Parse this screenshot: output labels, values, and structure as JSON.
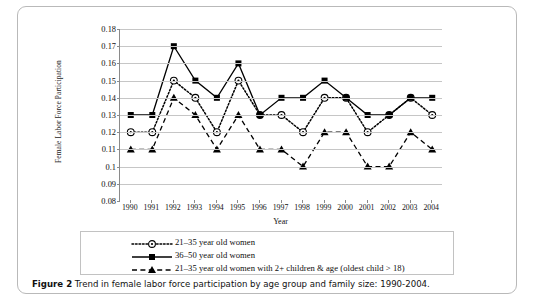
{
  "figure": {
    "caption_bold": "Figure 2",
    "caption_text": " Trend in female labor force participation by age group and family size: 1990-2004."
  },
  "chart_data": {
    "type": "line",
    "title": "",
    "xlabel": "Year",
    "ylabel": "Female Labor Force Participation",
    "categories": [
      "1990",
      "1991",
      "1992",
      "1993",
      "1994",
      "1995",
      "1996",
      "1997",
      "1998",
      "1999",
      "2000",
      "2001",
      "2002",
      "2003",
      "2004"
    ],
    "x": [
      1990,
      1991,
      1992,
      1993,
      1994,
      1995,
      1996,
      1997,
      1998,
      1999,
      2000,
      2001,
      2002,
      2003,
      2004
    ],
    "ylim": [
      0.08,
      0.18
    ],
    "yticks": [
      "0.18",
      "0.17",
      "0.16",
      "0.15",
      "0.14",
      "0.13",
      "0.12",
      "0.11",
      "0.1",
      "0.09",
      "0.08"
    ],
    "ytick_values": [
      0.18,
      0.17,
      0.16,
      0.15,
      0.14,
      0.13,
      0.12,
      0.11,
      0.1,
      0.09,
      0.08
    ],
    "grid": true,
    "legend_position": "bottom",
    "series": [
      {
        "name": "21–35 year old women",
        "marker": "circle-dot",
        "dash": "dotted",
        "color": "#000000",
        "values": [
          0.12,
          0.12,
          0.15,
          0.14,
          0.12,
          0.15,
          0.13,
          0.13,
          0.12,
          0.14,
          0.14,
          0.12,
          0.13,
          0.14,
          0.13
        ]
      },
      {
        "name": "36–50 year old women",
        "marker": "square",
        "dash": "solid",
        "color": "#000000",
        "values": [
          0.13,
          0.13,
          0.17,
          0.15,
          0.14,
          0.16,
          0.13,
          0.14,
          0.14,
          0.15,
          0.14,
          0.13,
          0.13,
          0.14,
          0.14
        ]
      },
      {
        "name": "21–35 year old women with 2+ children & age (oldest child > 18)",
        "marker": "triangle",
        "dash": "dashed",
        "color": "#000000",
        "values": [
          0.11,
          0.11,
          0.14,
          0.13,
          0.11,
          0.13,
          0.11,
          0.11,
          0.1,
          0.12,
          0.12,
          0.1,
          0.1,
          0.12,
          0.11
        ]
      }
    ]
  },
  "legend": {
    "items": [
      {
        "label": "21–35 year old women"
      },
      {
        "label": "36–50 year old women"
      },
      {
        "label": "21–35 year old women with 2+ children & age (oldest child > 18)"
      }
    ]
  }
}
